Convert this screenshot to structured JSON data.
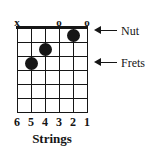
{
  "diagram": {
    "type": "guitar-chord-chart",
    "caption": "Strings",
    "string_markers": [
      {
        "symbol": "x",
        "string": 6,
        "x": 17
      },
      {
        "symbol": "o",
        "string": 3,
        "x": 59
      },
      {
        "symbol": "o",
        "string": 1,
        "x": 87
      }
    ],
    "string_numbers": [
      "6",
      "5",
      "4",
      "3",
      "2",
      "1"
    ],
    "grid": {
      "strings": 6,
      "fret_spaces": 6,
      "string_spacing": 14,
      "fret_spacing": 14,
      "line_color": "#161616",
      "nut_thickness": 3,
      "fret_thickness": 1
    },
    "finger_dots": [
      {
        "string": 2,
        "fret": 1,
        "cx": 56,
        "cy": 7
      },
      {
        "string": 4,
        "fret": 2,
        "cx": 28,
        "cy": 21
      },
      {
        "string": 5,
        "fret": 3,
        "cx": 14,
        "cy": 35
      }
    ],
    "callouts": [
      {
        "label": "Nut",
        "x": 92,
        "y": 24
      },
      {
        "label": "Frets",
        "x": 92,
        "y": 56
      }
    ],
    "colors": {
      "ink": "#161616",
      "background": "#ffffff"
    }
  }
}
